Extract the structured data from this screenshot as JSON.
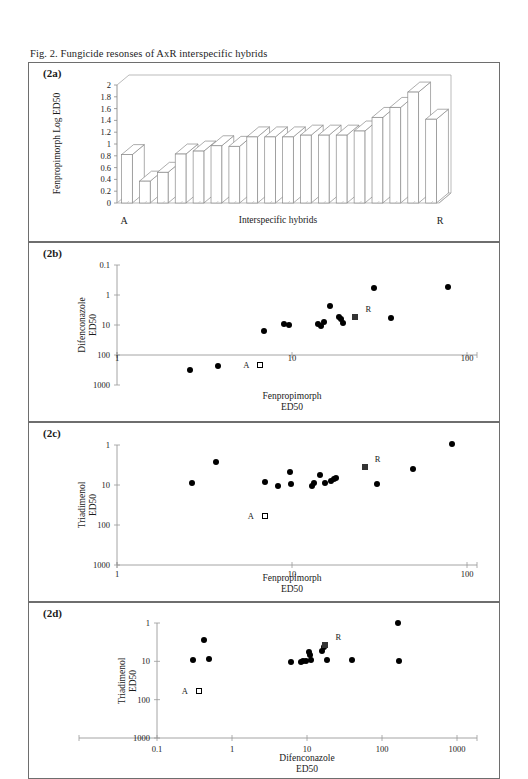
{
  "figure": {
    "caption": "Fig. 2.  Fungicide resonses of AxR interspecific hybrids"
  },
  "panels": {
    "a": {
      "label": "(2a)",
      "ylabel": "Fenpropimorph Log ED50",
      "xlabel": "Interspecific hybrids",
      "x_left_label": "A",
      "x_right_label": "R",
      "yticks": [
        "0",
        "0.2",
        "0.4",
        "0.6",
        "0.8",
        "1",
        "1.2",
        "1.4",
        "1.6",
        "1.8",
        "2"
      ]
    },
    "b": {
      "label": "(2b)",
      "ylabel_line1": "Difenconazole",
      "ylabel_line2": "ED50",
      "xlabel_line1": "Fenpropimorph",
      "xlabel_line2": "ED50",
      "yticks": [
        "1000",
        "100",
        "10",
        "1",
        "0.1"
      ],
      "xticks": [
        "1",
        "10",
        "100"
      ],
      "marker_a_label": "A",
      "marker_r_label": "R"
    },
    "c": {
      "label": "(2c)",
      "ylabel_line1": "Triadimenol",
      "ylabel_line2": "ED50",
      "xlabel_line1": "Fenpropimorph",
      "xlabel_line2": "ED50",
      "yticks": [
        "1000",
        "100",
        "10",
        "1"
      ],
      "xticks": [
        "1",
        "10",
        "100"
      ],
      "marker_a_label": "A",
      "marker_r_label": "R"
    },
    "d": {
      "label": "(2d)",
      "ylabel_line1": "Triadimenol",
      "ylabel_line2": "ED50",
      "xlabel_line1": "Difenconazole",
      "xlabel_line2": "ED50",
      "yticks": [
        "1000",
        "100",
        "10",
        "1"
      ],
      "xticks": [
        "0.1",
        "1",
        "10",
        "100",
        "1000"
      ],
      "marker_a_label": "A",
      "marker_r_label": "R"
    }
  },
  "chart_data": [
    {
      "id": "2a",
      "type": "bar",
      "title": "(2a)",
      "xlabel": "Interspecific hybrids",
      "ylabel": "Fenpropimorph Log ED50",
      "ylim": [
        0,
        2
      ],
      "ytick_values": [
        0,
        0.2,
        0.4,
        0.6,
        0.8,
        1.0,
        1.2,
        1.4,
        1.6,
        1.8,
        2.0
      ],
      "grid": false,
      "three_d": true,
      "categories": [
        "A",
        "h1",
        "h2",
        "h3",
        "h4",
        "h5",
        "h6",
        "h7",
        "h8",
        "h9",
        "h10",
        "h11",
        "h12",
        "h13",
        "h14",
        "h15",
        "h16",
        "R"
      ],
      "values": [
        0.82,
        0.37,
        0.52,
        0.83,
        0.88,
        0.97,
        0.96,
        1.12,
        1.12,
        1.12,
        1.15,
        1.15,
        1.15,
        1.22,
        1.45,
        1.62,
        1.88,
        1.42
      ]
    },
    {
      "id": "2b",
      "type": "scatter",
      "title": "(2b)",
      "xlabel": "Fenpropimorph ED50",
      "ylabel": "Difenconazole ED50",
      "xscale": "log",
      "yscale": "log",
      "xlim": [
        1,
        100
      ],
      "ylim": [
        0.1,
        1000
      ],
      "xtick_values": [
        1,
        10,
        100
      ],
      "ytick_values": [
        0.1,
        1,
        10,
        100,
        1000
      ],
      "grid": false,
      "series": [
        {
          "name": "interspecific hybrids",
          "marker": "filled-circle",
          "points": [
            [
              2.6,
              0.32
            ],
            [
              3.8,
              0.42
            ],
            [
              6.9,
              6.3
            ],
            [
              9.0,
              11
            ],
            [
              9.6,
              10
            ],
            [
              14.0,
              11
            ],
            [
              14.6,
              9.5
            ],
            [
              15.2,
              13
            ],
            [
              16.5,
              42
            ],
            [
              18.5,
              18
            ],
            [
              19.0,
              16
            ],
            [
              19.6,
              11.5
            ],
            [
              29.5,
              175
            ],
            [
              37.0,
              17
            ],
            [
              78.0,
              185
            ]
          ]
        },
        {
          "name": "A parent",
          "marker": "open-square",
          "points": [
            [
              6.6,
              0.45
            ]
          ],
          "label": "A"
        },
        {
          "name": "R parent",
          "marker": "filled-square",
          "points": [
            [
              23.0,
              18
            ]
          ],
          "label": "R"
        }
      ]
    },
    {
      "id": "2c",
      "type": "scatter",
      "title": "(2c)",
      "xlabel": "Fenpropimorph ED50",
      "ylabel": "Triadimenol ED50",
      "xscale": "log",
      "yscale": "log",
      "xlim": [
        1,
        100
      ],
      "ylim": [
        1,
        1000
      ],
      "xtick_values": [
        1,
        10,
        100
      ],
      "ytick_values": [
        1,
        10,
        100,
        1000
      ],
      "grid": false,
      "series": [
        {
          "name": "interspecific hybrids",
          "marker": "filled-circle",
          "points": [
            [
              2.7,
              115
            ],
            [
              3.7,
              370
            ],
            [
              7.0,
              120
            ],
            [
              8.3,
              95
            ],
            [
              9.8,
              210
            ],
            [
              9.9,
              108
            ],
            [
              13.0,
              95
            ],
            [
              13.4,
              110
            ],
            [
              14.5,
              180
            ],
            [
              15.5,
              115
            ],
            [
              16.8,
              125
            ],
            [
              17.3,
              140
            ],
            [
              17.8,
              148
            ],
            [
              30.5,
              108
            ],
            [
              49.0,
              245
            ],
            [
              82.0,
              1050
            ]
          ]
        },
        {
          "name": "A parent",
          "marker": "open-square",
          "points": [
            [
              7.0,
              17
            ]
          ],
          "label": "A"
        },
        {
          "name": "R parent",
          "marker": "filled-square",
          "points": [
            [
              26.0,
              290
            ]
          ],
          "label": "R"
        }
      ]
    },
    {
      "id": "2d",
      "type": "scatter",
      "title": "(2d)",
      "xlabel": "Difenconazole ED50",
      "ylabel": "Triadimenol ED50",
      "xscale": "log",
      "yscale": "log",
      "xlim": [
        0.1,
        1000
      ],
      "ylim": [
        1,
        1000
      ],
      "xtick_values": [
        0.1,
        1,
        10,
        100,
        1000
      ],
      "ytick_values": [
        1,
        10,
        100,
        1000
      ],
      "grid": false,
      "series": [
        {
          "name": "interspecific hybrids",
          "marker": "filled-circle",
          "points": [
            [
              0.3,
              110
            ],
            [
              0.42,
              360
            ],
            [
              0.5,
              115
            ],
            [
              6.2,
              97
            ],
            [
              8.3,
              95
            ],
            [
              8.9,
              100
            ],
            [
              9.6,
              105
            ],
            [
              10.5,
              175
            ],
            [
              11.0,
              150
            ],
            [
              11.2,
              110
            ],
            [
              16.0,
              190
            ],
            [
              17.0,
              230
            ],
            [
              18.5,
              110
            ],
            [
              40.0,
              110
            ],
            [
              165.0,
              1010
            ],
            [
              170.0,
              105
            ]
          ]
        },
        {
          "name": "A parent",
          "marker": "open-square",
          "points": [
            [
              0.36,
              17
            ]
          ],
          "label": "A"
        },
        {
          "name": "R parent",
          "marker": "filled-square",
          "points": [
            [
              17.5,
              260
            ]
          ],
          "label": "R"
        }
      ]
    }
  ]
}
